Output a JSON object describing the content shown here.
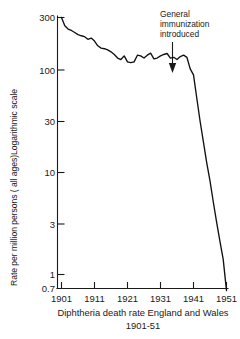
{
  "chart_data": {
    "type": "line",
    "title": "",
    "caption_line1": "Diphtheria death rate England and Wales",
    "caption_line2": "1901-51",
    "ylabel": "Rate per million persons ( all ages)Logarithmic scale",
    "xlabel": "",
    "yscale": "log",
    "ylim": [
      0.7,
      400
    ],
    "xlim": [
      1901,
      1953
    ],
    "grid": false,
    "legend": null,
    "ytick_labels": [
      "300",
      "100",
      "30",
      "10",
      "3",
      "1",
      "0.7"
    ],
    "ytick_values": [
      300,
      100,
      30,
      10,
      3,
      1,
      0.7
    ],
    "xtick_labels": [
      "1901",
      "1911",
      "1921",
      "1931",
      "1941",
      "1951"
    ],
    "xtick_values": [
      1901,
      1911,
      1921,
      1931,
      1941,
      1951
    ],
    "series": [
      {
        "name": "Diphtheria death rate",
        "x": [
          1901,
          1902,
          1903,
          1904,
          1905,
          1906,
          1907,
          1908,
          1909,
          1910,
          1911,
          1912,
          1913,
          1914,
          1915,
          1916,
          1917,
          1918,
          1919,
          1920,
          1921,
          1922,
          1923,
          1924,
          1925,
          1926,
          1927,
          1928,
          1929,
          1930,
          1931,
          1932,
          1933,
          1934,
          1935,
          1936,
          1937,
          1938,
          1939,
          1940,
          1941,
          1942,
          1943,
          1944,
          1945,
          1946,
          1947,
          1948,
          1949,
          1950,
          1951
        ],
        "values": [
          300,
          250,
          232,
          225,
          215,
          205,
          200,
          196,
          185,
          190,
          178,
          160,
          152,
          150,
          146,
          140,
          132,
          122,
          118,
          128,
          112,
          110,
          112,
          130,
          128,
          122,
          130,
          136,
          120,
          122,
          128,
          132,
          135,
          122,
          124,
          118,
          126,
          130,
          124,
          96,
          84,
          50,
          30,
          19,
          12,
          8,
          5,
          3.2,
          2.1,
          1.4,
          0.7
        ],
        "annotations": [
          {
            "text_lines": [
              "General",
              "immunization",
              "introduced"
            ],
            "x": 1941,
            "arrow": "down"
          }
        ]
      }
    ]
  }
}
